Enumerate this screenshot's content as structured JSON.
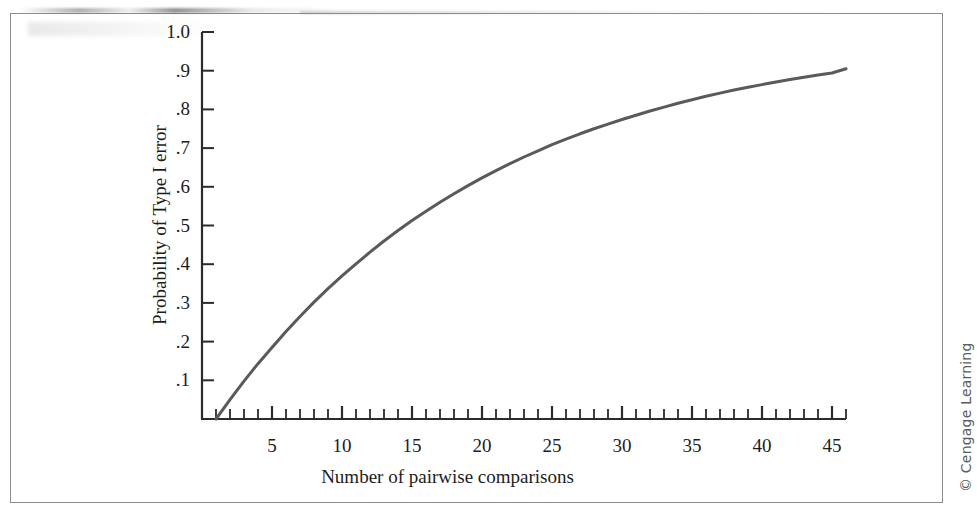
{
  "figure": {
    "credit": "© Cengage Learning",
    "frame_color": "#8d8d8d",
    "background": "#ffffff"
  },
  "chart_data": {
    "type": "line",
    "title": "",
    "subtitle": "",
    "xlabel": "Number of pairwise comparisons",
    "ylabel": "Probability of Type I error",
    "xlim": [
      0,
      46
    ],
    "ylim": [
      0,
      1.0
    ],
    "grid": false,
    "legend": null,
    "line_color": "#5a5a5a",
    "line_width": 3,
    "axis_color": "#2b2b2b",
    "annotation": "",
    "xticks_major": [
      5,
      10,
      15,
      20,
      25,
      30,
      35,
      40,
      45
    ],
    "xtick_labels": [
      "5",
      "10",
      "15",
      "20",
      "25",
      "30",
      "35",
      "40",
      "45"
    ],
    "xticks_minor_start": 1,
    "xticks_minor_end": 46,
    "xticks_minor_step": 1,
    "yticks": [
      0.1,
      0.2,
      0.3,
      0.4,
      0.5,
      0.6,
      0.7,
      0.8,
      0.9,
      1.0
    ],
    "ytick_labels": [
      ".1",
      ".2",
      ".3",
      ".4",
      ".5",
      ".6",
      ".7",
      ".8",
      ".9",
      "1.0"
    ],
    "alpha": 0.05,
    "x": [
      1,
      2,
      3,
      4,
      5,
      6,
      7,
      8,
      9,
      10,
      11,
      12,
      13,
      14,
      15,
      16,
      17,
      18,
      19,
      20,
      21,
      22,
      23,
      24,
      25,
      26,
      27,
      28,
      29,
      30,
      31,
      32,
      33,
      34,
      35,
      36,
      37,
      38,
      39,
      40,
      41,
      42,
      43,
      44,
      45,
      46
    ],
    "y": [
      0.0,
      0.05,
      0.098,
      0.143,
      0.185,
      0.226,
      0.265,
      0.302,
      0.337,
      0.37,
      0.401,
      0.431,
      0.46,
      0.487,
      0.513,
      0.537,
      0.56,
      0.582,
      0.603,
      0.623,
      0.642,
      0.66,
      0.677,
      0.693,
      0.709,
      0.723,
      0.737,
      0.75,
      0.762,
      0.774,
      0.785,
      0.796,
      0.806,
      0.816,
      0.825,
      0.834,
      0.842,
      0.85,
      0.857,
      0.864,
      0.871,
      0.877,
      0.883,
      0.889,
      0.894,
      0.905
    ]
  }
}
